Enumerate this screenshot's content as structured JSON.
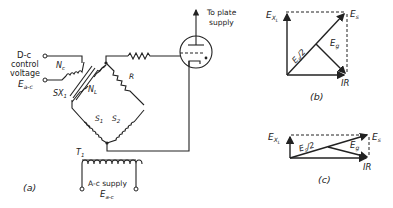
{
  "figure": {
    "a": {
      "caption": "(a)",
      "labels": {
        "dc_control_1": "D-c",
        "dc_control_2": "control",
        "dc_control_3": "voltage",
        "dc_control_sym": "E",
        "dc_control_sub": "a-c",
        "nc": "N",
        "nc_sub": "c",
        "nl": "N",
        "nl_sub": "L",
        "sx": "SX",
        "sx_sub": "1",
        "r": "R",
        "s1": "S",
        "s1_sub": "1",
        "s2": "S",
        "s2_sub": "2",
        "t1": "T",
        "t1_sub": "1",
        "plate_1": "To plate",
        "plate_2": "supply",
        "ac_supply": "A-c supply",
        "ac_sym": "E",
        "ac_sub": "a-c"
      }
    },
    "b": {
      "caption": "(b)",
      "labels": {
        "exl": "E",
        "exl_sub": "X",
        "exl_subsub": "L",
        "es": "E",
        "es_sub": "s",
        "es_half": "E",
        "es_half_sub": "s",
        "es_half_rest": "/2",
        "eg": "E",
        "eg_sub": "g",
        "ir": "IR"
      }
    },
    "c": {
      "caption": "(c)",
      "labels": {
        "exl": "E",
        "exl_sub": "X",
        "exl_subsub": "L",
        "es": "E",
        "es_sub": "s",
        "es_half": "E",
        "es_half_sub": "s",
        "es_half_rest": "/2",
        "eg": "E",
        "eg_sub": "g",
        "ir": "IR"
      }
    }
  }
}
